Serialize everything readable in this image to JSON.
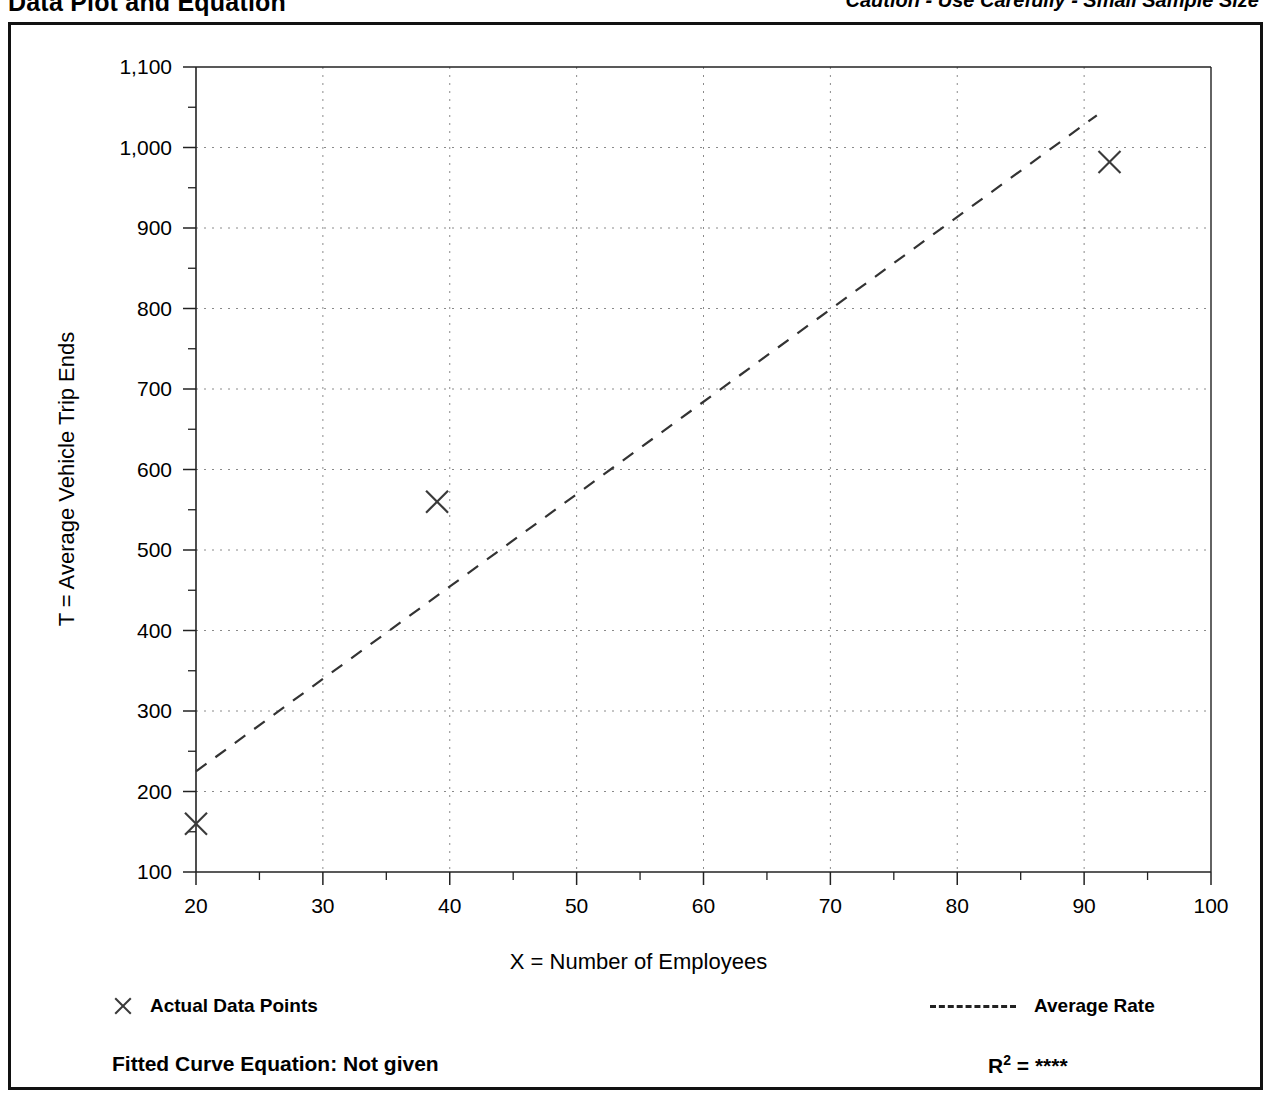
{
  "header": {
    "title": "Data Plot and Equation",
    "caution": "Caution - Use Carefully - Small Sample Size"
  },
  "legend": {
    "points_marker": "x-marker-icon",
    "points_label": "Actual Data Points",
    "rate_marker": "dashed-line-icon",
    "rate_label": "Average Rate"
  },
  "footer": {
    "fitted_equation": "Fitted Curve Equation:  Not given",
    "r_squared_base": "R",
    "r_squared_sup": "2",
    "r_squared_eq": " = ",
    "r_squared_value": "****"
  },
  "chart_data": {
    "type": "scatter",
    "title": "Data Plot and Equation",
    "xlabel": "X = Number of Employees",
    "ylabel": "T = Average Vehicle Trip Ends",
    "xlim": [
      20,
      100
    ],
    "ylim": [
      100,
      1100
    ],
    "xticks": [
      20,
      30,
      40,
      50,
      60,
      70,
      80,
      90,
      100
    ],
    "xtick_labels": [
      "20",
      "30",
      "40",
      "50",
      "60",
      "70",
      "80",
      "90",
      "100"
    ],
    "yticks": [
      100,
      200,
      300,
      400,
      500,
      600,
      700,
      800,
      900,
      1000,
      1100
    ],
    "ytick_labels": [
      "100",
      "200",
      "300",
      "400",
      "500",
      "600",
      "700",
      "800",
      "900",
      "1,000",
      "1,100"
    ],
    "y_minor_ticks": [
      150,
      250,
      350,
      450,
      550,
      650,
      750,
      850,
      950,
      1050
    ],
    "x_minor_ticks": [
      25,
      35,
      45,
      55,
      65,
      75,
      85,
      95
    ],
    "grid": "dotted-both-axes",
    "legend_position": "below-plot",
    "series": [
      {
        "name": "Actual Data Points",
        "type": "scatter",
        "marker": "x",
        "color": "#3a3a3a",
        "points": [
          {
            "x": 20,
            "y": 160
          },
          {
            "x": 39,
            "y": 560
          },
          {
            "x": 92,
            "y": 982
          }
        ]
      },
      {
        "name": "Average Rate",
        "type": "line",
        "style": "dashed",
        "color": "#333333",
        "points": [
          {
            "x": 20,
            "y": 225
          },
          {
            "x": 91,
            "y": 1040
          }
        ]
      }
    ]
  }
}
